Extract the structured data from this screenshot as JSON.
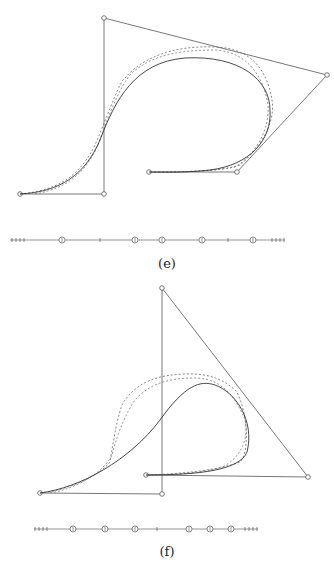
{
  "figures": [
    {
      "id": "e",
      "caption": "(e)",
      "control_polygon": [
        [
          20,
          194
        ],
        [
          104,
          194
        ],
        [
          104,
          18
        ],
        [
          327,
          75
        ],
        [
          237,
          172
        ],
        [
          149,
          172
        ]
      ],
      "curve_solid": "M20,194 C60,192 85,175 100,140 C115,100 135,62 185,58 C240,55 270,80 270,110 C272,140 250,165 210,170 C185,173 160,172 149,172",
      "curve_dash1": "M20,194 C60,190 80,175 95,145 C110,110 120,80 125,78 C140,60 170,45 215,47 C255,48 268,75 272,100 C276,125 258,150 240,165 C220,172 175,172 149,172",
      "curve_dash2": "M35,194 C70,188 88,170 100,140 C112,105 122,85 130,75 C150,55 180,50 215,50 C250,52 264,80 268,105 C270,130 255,155 235,167 C210,172 170,172 149,172",
      "knots": {
        "y": 240,
        "x_start": 10,
        "x_end": 285,
        "left_ticks": [
          12,
          16,
          20,
          24
        ],
        "right_ticks": [
          272,
          276,
          280,
          284
        ],
        "markers": [
          [
            62,
            "circle"
          ],
          [
            100,
            "tick"
          ],
          [
            135,
            "circle"
          ],
          [
            162,
            "circle"
          ],
          [
            202,
            "circle"
          ],
          [
            228,
            "tick"
          ],
          [
            253,
            "circle"
          ]
        ]
      }
    },
    {
      "id": "f",
      "caption": "(f)",
      "control_polygon": [
        [
          40,
          493
        ],
        [
          162,
          494
        ],
        [
          162,
          288
        ],
        [
          308,
          477
        ],
        [
          146,
          475
        ]
      ],
      "curve_solid": "M40,493 C80,488 130,460 160,420 C185,385 200,380 215,385 C235,392 255,420 247,452 C240,470 200,475 146,475",
      "curve_dash1": "M40,493 C70,490 100,475 110,462 C115,430 120,405 125,400 C140,380 160,375 185,374 C210,373 225,380 237,392 C250,420 248,455 240,462 C220,470 180,474 146,475",
      "curve_dash2": "M50,493 C80,488 105,470 112,455 C118,430 128,410 135,400 C150,383 170,378 195,378 C220,378 235,395 245,420 C250,445 235,462 220,468 C195,474 165,475 146,475",
      "knots": {
        "y": 529,
        "x_start": 34,
        "x_end": 258,
        "left_ticks": [
          35,
          39,
          43,
          47
        ],
        "right_ticks": [
          245,
          249,
          253,
          257
        ],
        "markers": [
          [
            73,
            "circle"
          ],
          [
            105,
            "circle"
          ],
          [
            135,
            "circle"
          ],
          [
            157,
            "tick"
          ],
          [
            189,
            "circle"
          ],
          [
            210,
            "circle"
          ],
          [
            231,
            "circle"
          ]
        ]
      }
    }
  ]
}
